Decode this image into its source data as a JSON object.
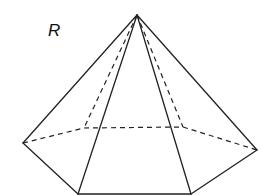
{
  "figure": {
    "label": "R",
    "shape": "hexagonal pyramid",
    "stroke_color": "#222222",
    "vertices": {
      "apex": [
        137,
        15
      ],
      "left": [
        23,
        143
      ],
      "back_left": [
        84,
        128
      ],
      "back_right": [
        183,
        127
      ],
      "right": [
        257,
        150
      ],
      "front_right": [
        191,
        194
      ],
      "front_left": [
        78,
        194
      ]
    }
  }
}
